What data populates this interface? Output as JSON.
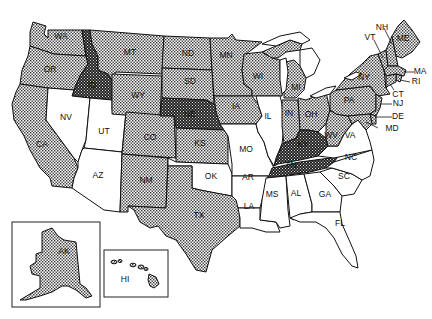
{
  "map": {
    "title": "",
    "legend": [],
    "categories": {
      "none": {
        "fill": "#ffffff",
        "pattern": "none"
      },
      "light": {
        "fill": "#bdbdbd",
        "pattern": "light-stipple"
      },
      "dark": {
        "fill": "#3a3a3a",
        "pattern": "dark-stipple"
      }
    },
    "states": [
      {
        "abbr": "WA",
        "category": "light"
      },
      {
        "abbr": "OR",
        "category": "light"
      },
      {
        "abbr": "CA",
        "category": "light"
      },
      {
        "abbr": "ID",
        "category": "dark"
      },
      {
        "abbr": "NV",
        "category": "none"
      },
      {
        "abbr": "UT",
        "category": "none"
      },
      {
        "abbr": "AZ",
        "category": "none"
      },
      {
        "abbr": "MT",
        "category": "light"
      },
      {
        "abbr": "WY",
        "category": "light"
      },
      {
        "abbr": "CO",
        "category": "light"
      },
      {
        "abbr": "NM",
        "category": "light"
      },
      {
        "abbr": "ND",
        "category": "light"
      },
      {
        "abbr": "SD",
        "category": "light"
      },
      {
        "abbr": "NE",
        "category": "dark"
      },
      {
        "abbr": "KS",
        "category": "light"
      },
      {
        "abbr": "OK",
        "category": "none"
      },
      {
        "abbr": "TX",
        "category": "light"
      },
      {
        "abbr": "MN",
        "category": "light"
      },
      {
        "abbr": "IA",
        "category": "light"
      },
      {
        "abbr": "MO",
        "category": "none"
      },
      {
        "abbr": "AR",
        "category": "none"
      },
      {
        "abbr": "LA",
        "category": "none"
      },
      {
        "abbr": "WI",
        "category": "light"
      },
      {
        "abbr": "IL",
        "category": "none"
      },
      {
        "abbr": "MI",
        "category": "light"
      },
      {
        "abbr": "IN",
        "category": "light"
      },
      {
        "abbr": "OH",
        "category": "light"
      },
      {
        "abbr": "KY",
        "category": "dark"
      },
      {
        "abbr": "TN",
        "category": "dark"
      },
      {
        "abbr": "MS",
        "category": "none"
      },
      {
        "abbr": "AL",
        "category": "none"
      },
      {
        "abbr": "GA",
        "category": "none"
      },
      {
        "abbr": "FL",
        "category": "none"
      },
      {
        "abbr": "SC",
        "category": "none"
      },
      {
        "abbr": "NC",
        "category": "none"
      },
      {
        "abbr": "VA",
        "category": "none"
      },
      {
        "abbr": "WV",
        "category": "light"
      },
      {
        "abbr": "PA",
        "category": "light"
      },
      {
        "abbr": "NY",
        "category": "light"
      },
      {
        "abbr": "VT",
        "category": "light"
      },
      {
        "abbr": "NH",
        "category": "light"
      },
      {
        "abbr": "ME",
        "category": "light"
      },
      {
        "abbr": "MA",
        "category": "light"
      },
      {
        "abbr": "RI",
        "category": "light"
      },
      {
        "abbr": "CT",
        "category": "light"
      },
      {
        "abbr": "NJ",
        "category": "light"
      },
      {
        "abbr": "DE",
        "category": "light"
      },
      {
        "abbr": "MD",
        "category": "light"
      },
      {
        "abbr": "AK",
        "category": "light"
      },
      {
        "abbr": "HI",
        "category": "light"
      }
    ],
    "labels": {
      "WA": "WA",
      "OR": "OR",
      "CA": "CA",
      "ID": "ID",
      "NV": "NV",
      "UT": "UT",
      "AZ": "AZ",
      "MT": "MT",
      "WY": "WY",
      "CO": "CO",
      "NM": "NM",
      "ND": "ND",
      "SD": "SD",
      "NE": "NE",
      "KS": "KS",
      "OK": "OK",
      "TX": "TX",
      "MN": "MN",
      "IA": "IA",
      "MO": "MO",
      "AR": "AR",
      "LA": "LA",
      "WI": "WI",
      "IL": "IL",
      "MI": "MI",
      "IN": "IN",
      "OH": "OH",
      "KY": "KY",
      "TN": "TN",
      "MS": "MS",
      "AL": "AL",
      "GA": "GA",
      "FL": "FL",
      "SC": "SC",
      "NC": "NC",
      "VA": "VA",
      "WV": "WV",
      "PA": "PA",
      "NY": "NY",
      "VT": "VT",
      "NH": "NH",
      "ME": "ME",
      "MA": "MA",
      "RI": "RI",
      "CT": "CT",
      "NJ": "NJ",
      "DE": "DE",
      "MD": "MD",
      "AK": "AK",
      "HI": "HI"
    },
    "insets": [
      {
        "name": "alaska-inset",
        "label": "AK"
      },
      {
        "name": "hawaii-inset",
        "label": "HI"
      }
    ]
  }
}
